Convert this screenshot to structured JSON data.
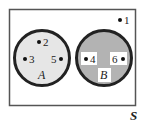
{
  "diagram": {
    "type": "venn",
    "universe": {
      "label": "S",
      "elements_outside": [
        "1"
      ]
    },
    "sets": [
      {
        "label": "A",
        "elements": [
          "2",
          "3",
          "5"
        ],
        "fill": "#e6e6e6"
      },
      {
        "label": "B",
        "elements": [
          "4",
          "6"
        ],
        "fill": "#b3b3b3"
      }
    ],
    "points": [
      {
        "label": "1"
      },
      {
        "label": "2"
      },
      {
        "label": "3"
      },
      {
        "label": "5"
      },
      {
        "label": "4"
      },
      {
        "label": "6"
      }
    ],
    "colors": {
      "border": "#333333",
      "circle_stroke": "#222222",
      "set_a_fill": "#e6e6e6",
      "set_b_fill": "#b3b3b3",
      "label_box": "#ffffff"
    }
  }
}
